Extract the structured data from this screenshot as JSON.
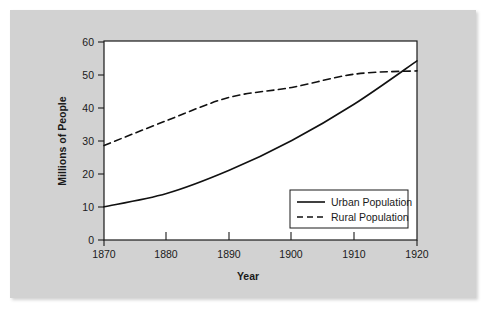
{
  "figure": {
    "background_color": "#d2d2d2",
    "plot_background_color": "#ffffff",
    "line_color": "#111111"
  },
  "chart_data": {
    "type": "line",
    "title": "",
    "xlabel": "Year",
    "ylabel": "Millions of People",
    "x": [
      1870,
      1880,
      1890,
      1900,
      1910,
      1920
    ],
    "xlim": [
      1870,
      1920
    ],
    "ylim": [
      0,
      60
    ],
    "xticks": [
      1870,
      1880,
      1890,
      1900,
      1910,
      1920
    ],
    "xtick_labels": [
      "1870",
      "1880",
      "1890",
      "1900",
      "1910",
      "1920"
    ],
    "yticks": [
      0,
      10,
      20,
      30,
      40,
      50,
      60
    ],
    "ytick_labels": [
      "0",
      "10",
      "20",
      "30",
      "40",
      "50",
      "60"
    ],
    "grid": false,
    "legend_position": "lower right",
    "series": [
      {
        "name": "Urban Population",
        "style": "solid",
        "values": [
          10,
          14,
          21,
          30,
          41,
          54
        ]
      },
      {
        "name": "Rural Population",
        "style": "dashed",
        "values": [
          28.5,
          36,
          43,
          46,
          50,
          51
        ]
      }
    ]
  },
  "legend": {
    "entries": [
      {
        "label": "Urban Population",
        "style": "solid"
      },
      {
        "label": "Rural Population",
        "style": "dashed"
      }
    ]
  }
}
